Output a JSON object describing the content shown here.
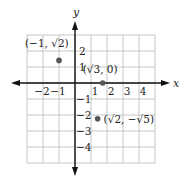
{
  "chart_data": {
    "type": "scatter",
    "title": "",
    "xlabel": "x",
    "ylabel": "y",
    "xlim": [
      -3,
      5
    ],
    "ylim": [
      -5,
      3
    ],
    "grid": true,
    "x_ticks": [
      {
        "value": -2,
        "label": "-2"
      },
      {
        "value": -1,
        "label": "-1"
      },
      {
        "value": 1,
        "label": "1"
      },
      {
        "value": 2,
        "label": "2"
      },
      {
        "value": 3,
        "label": "3"
      },
      {
        "value": 4,
        "label": "4"
      }
    ],
    "y_ticks": [
      {
        "value": 2,
        "label": "2"
      },
      {
        "value": 1,
        "label": "1"
      },
      {
        "value": -1,
        "label": "-1"
      },
      {
        "value": -2,
        "label": "-2"
      },
      {
        "value": -3,
        "label": "-3"
      },
      {
        "value": -4,
        "label": "-4"
      }
    ],
    "points": [
      {
        "x": -1,
        "y": 1.414,
        "label": "(-1, √2)"
      },
      {
        "x": 1.732,
        "y": 0,
        "label": "(√3, 0)"
      },
      {
        "x": 1.414,
        "y": -2.236,
        "label": "(√2, -√5)"
      }
    ],
    "colors": {
      "grid": "#b8b8b8",
      "axis": "#111111",
      "point": "#555555"
    }
  }
}
